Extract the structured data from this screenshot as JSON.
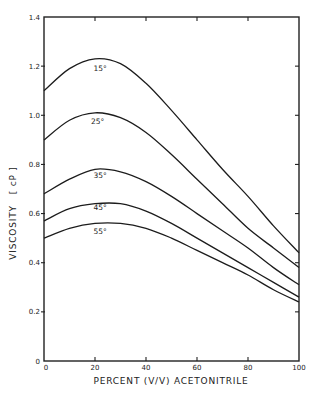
{
  "chart_data": {
    "type": "line",
    "title": "",
    "xlabel": "PERCENT (V/V) ACETONITRILE",
    "ylabel": "VISCOSITY   [ cP ]",
    "xlim": [
      0,
      100
    ],
    "ylim": [
      0,
      1.4
    ],
    "x_ticks": [
      0,
      20,
      40,
      60,
      80,
      100
    ],
    "x_tick_labels": [
      "0",
      "20",
      "40",
      "60",
      "80",
      "100"
    ],
    "y_ticks": [
      0,
      0.2,
      0.4,
      0.6,
      0.8,
      1.0,
      1.2,
      1.4
    ],
    "y_tick_labels": [
      "0",
      "0.2",
      "0.4",
      "0.6",
      "0.8",
      "1.0",
      "1.2",
      "1.4"
    ],
    "grid": false,
    "legend": "inline labels above curves",
    "x": [
      0,
      10,
      20,
      30,
      40,
      50,
      60,
      70,
      80,
      90,
      100
    ],
    "series": [
      {
        "name": "15°",
        "label_pos": [
          22,
          1.18
        ],
        "values": [
          1.1,
          1.19,
          1.23,
          1.21,
          1.13,
          1.02,
          0.9,
          0.78,
          0.67,
          0.55,
          0.44
        ]
      },
      {
        "name": "25°",
        "label_pos": [
          21,
          0.965
        ],
        "values": [
          0.9,
          0.98,
          1.01,
          0.99,
          0.93,
          0.84,
          0.74,
          0.64,
          0.54,
          0.46,
          0.38
        ]
      },
      {
        "name": "35°",
        "label_pos": [
          22,
          0.745
        ],
        "values": [
          0.68,
          0.74,
          0.78,
          0.77,
          0.73,
          0.67,
          0.6,
          0.53,
          0.46,
          0.38,
          0.31
        ]
      },
      {
        "name": "45°",
        "label_pos": [
          22,
          0.615
        ],
        "values": [
          0.57,
          0.62,
          0.64,
          0.64,
          0.61,
          0.56,
          0.5,
          0.44,
          0.38,
          0.32,
          0.26
        ]
      },
      {
        "name": "55°",
        "label_pos": [
          22,
          0.515
        ],
        "values": [
          0.5,
          0.54,
          0.56,
          0.56,
          0.54,
          0.5,
          0.45,
          0.4,
          0.35,
          0.29,
          0.24
        ]
      }
    ]
  },
  "labels": {
    "xlabel": "PERCENT (V/V) ACETONITRILE",
    "ylabel": "VISCOSITY   [ cP ]",
    "series": [
      "15°",
      "25°",
      "35°",
      "45°",
      "55°"
    ],
    "x_ticks": [
      "0",
      "20",
      "40",
      "60",
      "80",
      "100"
    ],
    "y_ticks": [
      "0",
      "0.2",
      "0.4",
      "0.6",
      "0.8",
      "1.0",
      "1.2",
      "1.4"
    ]
  }
}
